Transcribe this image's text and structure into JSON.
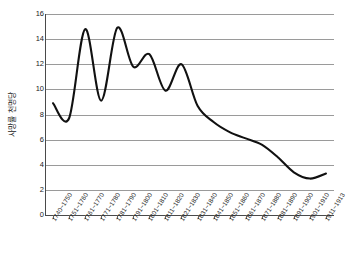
{
  "chart_data": {
    "type": "line",
    "title": "",
    "xlabel": "",
    "ylabel": "사망률 천명당",
    "ylim": [
      0,
      16
    ],
    "yticks": [
      0,
      2,
      4,
      6,
      8,
      10,
      12,
      14,
      16
    ],
    "grid": true,
    "legend": "none",
    "categories": [
      "1740~1750",
      "1751~1760",
      "1761~1770",
      "1771~1780",
      "1781~1790",
      "1791~1800",
      "1801~1810",
      "1811~1820",
      "1821~1830",
      "1831~1840",
      "1841~1850",
      "1851~1860",
      "1861~1870",
      "1871~1880",
      "1881~1890",
      "1891~1900",
      "1901~1910",
      "1911~1913"
    ],
    "values": [
      8.9,
      7.7,
      14.8,
      9.1,
      14.9,
      11.8,
      12.8,
      9.9,
      12.0,
      8.7,
      7.4,
      6.6,
      6.1,
      5.6,
      4.6,
      3.4,
      2.9,
      3.3
    ],
    "series": [
      {
        "name": "사망률",
        "color": "#111111",
        "values": [
          8.9,
          7.7,
          14.8,
          9.1,
          14.9,
          11.8,
          12.8,
          9.9,
          12.0,
          8.7,
          7.4,
          6.6,
          6.1,
          5.6,
          4.6,
          3.4,
          2.9,
          3.3
        ]
      }
    ]
  },
  "axes": {
    "y_title": "사망률 천명당",
    "y_tick_labels": [
      "16",
      "14",
      "12",
      "10",
      "8",
      "6",
      "4",
      "2",
      "0"
    ],
    "x_tick_labels": [
      "1740~1750",
      "1751~1760",
      "1761~1770",
      "1771~1780",
      "1781~1790",
      "1791~1800",
      "1801~1810",
      "1811~1820",
      "1821~1830",
      "1831~1840",
      "1841~1850",
      "1851~1860",
      "1861~1870",
      "1871~1880",
      "1881~1890",
      "1891~1900",
      "1901~1910",
      "1911~1913"
    ]
  },
  "colors": {
    "series": "#111111",
    "grid": "#9a9a9a",
    "axis": "#4a4a4a",
    "background": "#ffffff",
    "text": "#1a1a1a"
  }
}
